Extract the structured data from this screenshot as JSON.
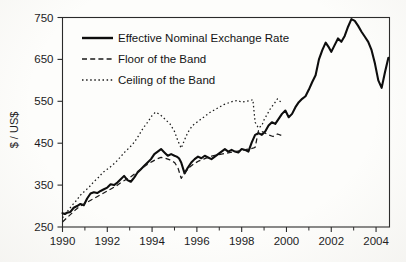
{
  "chart_data": {
    "type": "line",
    "title": "",
    "xlabel": "",
    "ylabel": "$ / US$",
    "xlim": [
      1990,
      2004.6
    ],
    "ylim": [
      250,
      750
    ],
    "ytick_values": [
      250,
      350,
      450,
      550,
      650,
      750
    ],
    "ytick_labels": [
      "250",
      "350",
      "450",
      "550",
      "650",
      "750"
    ],
    "xtick_values": [
      1990,
      1992,
      1994,
      1996,
      1998,
      2000,
      2002,
      2004
    ],
    "xtick_labels": [
      "1990",
      "1992",
      "1994",
      "1996",
      "1998",
      "2000",
      "2002",
      "2004"
    ],
    "xtick_minor_values": [
      1991,
      1993,
      1995,
      1997,
      1999,
      2001,
      2003
    ],
    "grid": false,
    "legend_position": "upper-left-inside",
    "series": [
      {
        "name": "Effective Nominal Exchange Rate",
        "style": "solid",
        "color": "#0d0d0d",
        "x": [
          1990.0,
          1990.1,
          1990.2,
          1990.35,
          1990.5,
          1990.65,
          1990.8,
          1990.95,
          1991.1,
          1991.25,
          1991.4,
          1991.55,
          1991.7,
          1991.85,
          1992.0,
          1992.15,
          1992.3,
          1992.45,
          1992.6,
          1992.75,
          1992.9,
          1993.05,
          1993.2,
          1993.35,
          1993.5,
          1993.65,
          1993.8,
          1993.95,
          1994.1,
          1994.25,
          1994.4,
          1994.55,
          1994.7,
          1994.85,
          1995.0,
          1995.1,
          1995.2,
          1995.3,
          1995.45,
          1995.6,
          1995.75,
          1995.9,
          1996.05,
          1996.2,
          1996.35,
          1996.5,
          1996.65,
          1996.8,
          1996.95,
          1997.1,
          1997.25,
          1997.4,
          1997.55,
          1997.7,
          1997.85,
          1998.0,
          1998.15,
          1998.3,
          1998.45,
          1998.6,
          1998.75,
          1998.9,
          1999.05,
          1999.2,
          1999.35,
          1999.5,
          1999.65,
          1999.8,
          1999.95,
          2000.1,
          2000.25,
          2000.4,
          2000.55,
          2000.7,
          2000.85,
          2001.0,
          2001.15,
          2001.3,
          2001.45,
          2001.6,
          2001.75,
          2001.9,
          2002.0,
          2002.15,
          2002.3,
          2002.45,
          2002.6,
          2002.75,
          2002.9,
          2003.05,
          2003.2,
          2003.35,
          2003.5,
          2003.65,
          2003.8,
          2003.95,
          2004.1,
          2004.25,
          2004.4,
          2004.55
        ],
        "y": [
          283,
          281,
          284,
          286,
          296,
          300,
          305,
          302,
          318,
          330,
          333,
          331,
          336,
          340,
          344,
          352,
          350,
          356,
          364,
          372,
          362,
          358,
          368,
          380,
          388,
          396,
          404,
          412,
          424,
          430,
          436,
          428,
          420,
          424,
          420,
          418,
          414,
          404,
          378,
          392,
          404,
          412,
          418,
          414,
          420,
          416,
          412,
          418,
          424,
          430,
          436,
          430,
          434,
          430,
          428,
          436,
          434,
          430,
          452,
          470,
          474,
          470,
          478,
          492,
          500,
          496,
          508,
          520,
          528,
          512,
          520,
          536,
          548,
          556,
          562,
          578,
          596,
          612,
          650,
          672,
          690,
          678,
          668,
          684,
          700,
          692,
          706,
          728,
          746,
          742,
          730,
          716,
          704,
          692,
          672,
          640,
          600,
          582,
          620,
          654
        ]
      },
      {
        "name": "Floor of the Band",
        "style": "dashed",
        "color": "#1a1a1a",
        "x": [
          1990.0,
          1990.2,
          1990.4,
          1990.6,
          1990.8,
          1991.0,
          1991.2,
          1991.4,
          1991.6,
          1991.8,
          1992.0,
          1992.2,
          1992.4,
          1992.6,
          1992.8,
          1993.0,
          1993.2,
          1993.4,
          1993.6,
          1993.8,
          1994.0,
          1994.2,
          1994.4,
          1994.6,
          1994.8,
          1995.0,
          1995.15,
          1995.3,
          1995.5,
          1995.7,
          1995.9,
          1996.1,
          1996.3,
          1996.5,
          1996.7,
          1996.9,
          1997.1,
          1997.3,
          1997.5,
          1997.7,
          1997.9,
          1998.1,
          1998.3,
          1998.5,
          1998.6,
          1998.75,
          1998.9,
          1999.05,
          1999.2,
          1999.4,
          1999.6,
          1999.8
        ],
        "y": [
          262,
          272,
          282,
          292,
          300,
          306,
          312,
          318,
          324,
          330,
          336,
          342,
          348,
          356,
          362,
          368,
          376,
          384,
          392,
          400,
          406,
          412,
          416,
          414,
          410,
          404,
          392,
          366,
          382,
          394,
          402,
          408,
          412,
          416,
          420,
          422,
          424,
          426,
          428,
          430,
          432,
          434,
          436,
          438,
          440,
          480,
          478,
          474,
          470,
          466,
          472,
          468
        ]
      },
      {
        "name": "Ceiling of the Band",
        "style": "dotted",
        "color": "#1a1a1a",
        "x": [
          1990.0,
          1990.2,
          1990.4,
          1990.6,
          1990.8,
          1991.0,
          1991.2,
          1991.4,
          1991.6,
          1991.8,
          1992.0,
          1992.2,
          1992.4,
          1992.6,
          1992.8,
          1993.0,
          1993.2,
          1993.4,
          1993.6,
          1993.8,
          1994.0,
          1994.15,
          1994.3,
          1994.45,
          1994.6,
          1994.8,
          1995.0,
          1995.15,
          1995.3,
          1995.45,
          1995.6,
          1995.8,
          1996.0,
          1996.2,
          1996.4,
          1996.6,
          1996.8,
          1997.0,
          1997.2,
          1997.4,
          1997.6,
          1997.8,
          1998.0,
          1998.2,
          1998.4,
          1998.5,
          1998.6,
          1998.75,
          1998.9,
          1999.0,
          1999.15,
          1999.3,
          1999.45,
          1999.6,
          1999.75
        ],
        "y": [
          272,
          286,
          300,
          312,
          326,
          336,
          346,
          358,
          368,
          380,
          388,
          396,
          406,
          418,
          430,
          440,
          452,
          468,
          486,
          500,
          516,
          524,
          520,
          514,
          506,
          496,
          478,
          456,
          438,
          458,
          476,
          492,
          500,
          508,
          516,
          524,
          530,
          536,
          542,
          546,
          550,
          552,
          548,
          550,
          552,
          554,
          500,
          486,
          492,
          506,
          520,
          534,
          544,
          556,
          548
        ]
      }
    ]
  },
  "legend": {
    "items": [
      {
        "label": "Effective Nominal Exchange Rate",
        "marker": "solid-line-icon"
      },
      {
        "label": "Floor of the Band",
        "marker": "dashed-line-icon"
      },
      {
        "label": "Ceiling of the Band",
        "marker": "dotted-line-icon"
      }
    ]
  }
}
